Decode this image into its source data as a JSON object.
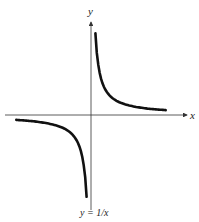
{
  "chart_data": {
    "type": "line",
    "title": "",
    "caption": "y = 1/x",
    "xlabel": "x",
    "ylabel": "y",
    "grid": false,
    "legend": null,
    "function": "1/x",
    "asymptotes": [
      "x = 0",
      "y = 0"
    ],
    "xlim": [
      -4.5,
      4.5
    ],
    "ylim": [
      -4.5,
      4.5
    ],
    "series": [
      {
        "name": "y = 1/x (x > 0)",
        "x": [
          0.25,
          0.33,
          0.5,
          0.75,
          1,
          1.5,
          2,
          2.5,
          3,
          3.5,
          4.2
        ],
        "y": [
          4.0,
          3.0,
          2.0,
          1.33,
          1.0,
          0.67,
          0.5,
          0.4,
          0.33,
          0.29,
          0.24
        ]
      },
      {
        "name": "y = 1/x (x < 0)",
        "x": [
          -4.2,
          -3.5,
          -3,
          -2.5,
          -2,
          -1.5,
          -1,
          -0.75,
          -0.5,
          -0.33,
          -0.25
        ],
        "y": [
          -0.24,
          -0.29,
          -0.33,
          -0.4,
          -0.5,
          -0.67,
          -1.0,
          -1.33,
          -2.0,
          -3.0,
          -4.0
        ]
      }
    ]
  },
  "colors": {
    "curve": "#111111",
    "axis": "#333333",
    "background": "#ffffff"
  }
}
